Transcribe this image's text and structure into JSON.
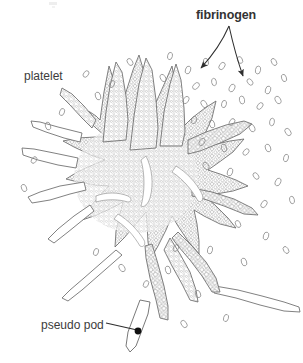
{
  "figure": {
    "type": "scientific-illustration",
    "background_color": "#ffffff",
    "ink_color": "#4a4a4a",
    "text_color": "#3a3a3a",
    "width": 303,
    "height": 363
  },
  "labels": {
    "fibrinogen": "fibrinogen",
    "platelet": "platelet",
    "pseudo_pod": "pseudo pod"
  },
  "annotations": [
    {
      "name": "fibrinogen-arrow-left",
      "label": "fibrinogen",
      "style": "arrow",
      "from": [
        229,
        26
      ],
      "to": [
        200,
        70
      ]
    },
    {
      "name": "fibrinogen-arrow-right",
      "label": "fibrinogen",
      "style": "arrow",
      "from": [
        229,
        26
      ],
      "to": [
        243,
        78
      ]
    },
    {
      "name": "pseudo-pod-leader",
      "label": "pseudo pod",
      "style": "leader-line-with-dot",
      "from": [
        105,
        324
      ],
      "to": [
        137,
        331
      ]
    }
  ]
}
